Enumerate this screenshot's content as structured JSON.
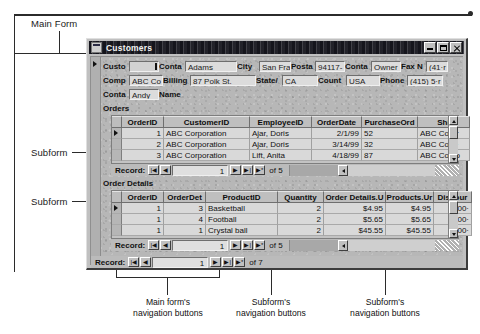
{
  "annotations": {
    "main_form": "Main Form",
    "subform_orders": "Subform",
    "subform_details": "Subform",
    "caption_main_nav": [
      "Main form's",
      "navigation buttons"
    ],
    "caption_sub_nav_1": [
      "Subform's",
      "navigation buttons"
    ],
    "caption_sub_nav_2": [
      "Subform's",
      "navigation buttons"
    ]
  },
  "window": {
    "title": "Customers",
    "icon": "form-view-icon",
    "minimize": "_",
    "maximize": "□",
    "close": "×"
  },
  "main_form": {
    "fields_row1": [
      {
        "label": "Custo",
        "value": "",
        "selected": true,
        "caret": true,
        "lw": 26,
        "vw": 30
      },
      {
        "label": "Conta",
        "value": "Adams",
        "lw": 26,
        "vw": 52
      },
      {
        "label": "City",
        "value": "San Fra",
        "lw": 22,
        "vw": 32
      },
      {
        "label": "Posta",
        "value": "94117-",
        "lw": 24,
        "vw": 30
      },
      {
        "label": "Conta",
        "value": "Owner",
        "lw": 26,
        "vw": 30
      },
      {
        "label": "Fax N",
        "value": "(41·r",
        "lw": 25,
        "vw": 22
      }
    ],
    "fields_row2": [
      {
        "label": "Comp",
        "value": "ABC Co",
        "lw": 26,
        "vw": 34
      },
      {
        "label": "Billing",
        "value": "87 Polk St.",
        "lw": 27,
        "vw": 66
      },
      {
        "label": "State/",
        "value": "CA",
        "lw": 26,
        "vw": 36
      },
      {
        "label": "Count",
        "value": "USA",
        "lw": 28,
        "vw": 34
      },
      {
        "label": "Phone",
        "value": "(415) 5·r",
        "lw": 27,
        "vw": 36
      }
    ],
    "fields_row3": [
      {
        "label": "Conta",
        "value": "Andy",
        "lw": 26,
        "vw": 30
      },
      {
        "label": "Name",
        "value": null,
        "lw": 30,
        "vw": 0
      }
    ],
    "orders_section_title": "Orders",
    "details_section_title": "Order Details"
  },
  "orders_subform": {
    "columns": [
      {
        "name": "OrderID",
        "w": 42,
        "align": "num"
      },
      {
        "name": "CustomerID",
        "w": 86,
        "align": "txt"
      },
      {
        "name": "EmployeeID",
        "w": 62,
        "align": "txt"
      },
      {
        "name": "OrderDate",
        "w": 50,
        "align": "num"
      },
      {
        "name": "PurchaseOrd",
        "w": 56,
        "align": "txt"
      },
      {
        "name": "Shi",
        "w": 52,
        "align": "txt"
      }
    ],
    "rows": [
      {
        "current": true,
        "cells": [
          "1",
          "ABC Corporation",
          "Ajar, Doris",
          "2/1/99",
          "52",
          "ABC Corpr"
        ]
      },
      {
        "current": false,
        "cells": [
          "2",
          "ABC Corporation",
          "Ajar, Doris",
          "3/14/99",
          "32",
          "ABC Corp·"
        ]
      },
      {
        "current": false,
        "cells": [
          "3",
          "ABC Corporation",
          "Lift, Anita",
          "4/18/99",
          "87",
          "ABC Comp"
        ]
      }
    ],
    "nav": {
      "label": "Record:",
      "first": "|◀",
      "prev": "◀",
      "value": "1",
      "next": "▶",
      "last": "▶|",
      "new": "▶*",
      "of_label": "of 5"
    }
  },
  "details_subform": {
    "columns": [
      {
        "name": "OrderID",
        "w": 42,
        "align": "num"
      },
      {
        "name": "OrderDet",
        "w": 42,
        "align": "num"
      },
      {
        "name": "ProductID",
        "w": 72,
        "align": "txt"
      },
      {
        "name": "Quantity",
        "w": 46,
        "align": "num"
      },
      {
        "name": "Order Details.U",
        "w": 62,
        "align": "num"
      },
      {
        "name": "Products.Ur",
        "w": 48,
        "align": "num"
      },
      {
        "name": "Discour",
        "w": 38,
        "align": "num"
      }
    ],
    "rows": [
      {
        "current": true,
        "cells": [
          "1",
          "3",
          "Basketball",
          "2",
          "$4.95",
          "$4.95",
          "0.00·"
        ]
      },
      {
        "current": false,
        "cells": [
          "1",
          "4",
          "Football",
          "2",
          "$5.65",
          "$5.65",
          "0.00·"
        ]
      },
      {
        "current": false,
        "cells": [
          "1",
          "1",
          "Crystal ball",
          "2",
          "$45.55",
          "$45.55",
          "0.00·"
        ]
      }
    ],
    "nav": {
      "label": "Record:",
      "first": "|◀",
      "prev": "◀",
      "value": "1",
      "next": "▶",
      "last": "▶|",
      "new": "▶*",
      "of_label": "of 5"
    }
  },
  "main_nav": {
    "label": "Record:",
    "first": "|◀",
    "prev": "◀",
    "value": "1",
    "next": "▶",
    "last": "▶|",
    "new": "▶*",
    "of_label": "of 7"
  },
  "colors": {
    "window_face": "#c0c0c0",
    "form_face": "#b7b7b7",
    "titlebar": "#15151c",
    "field_face": "#dcdcdc",
    "datasheet_row": "#d9d9d9",
    "annotation_text": "#1a1a1a"
  }
}
